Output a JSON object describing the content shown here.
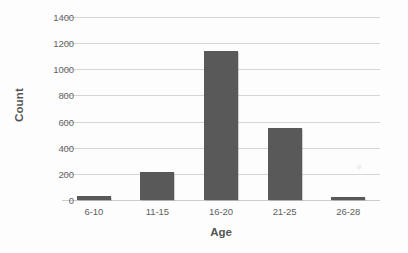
{
  "chart_data": {
    "type": "bar",
    "title": "",
    "categories": [
      "6-10",
      "11-15",
      "16-20",
      "21-25",
      "26-28"
    ],
    "values": [
      30,
      215,
      1140,
      550,
      20
    ],
    "series": [
      {
        "name": "Count",
        "values": [
          30,
          215,
          1140,
          550,
          20
        ]
      }
    ],
    "xlabel": "Age",
    "ylabel": "Count",
    "ylim": [
      0,
      1400
    ],
    "ytick_values": [
      0,
      200,
      400,
      600,
      800,
      1000,
      1200,
      1400
    ],
    "ytick_labels": [
      "0",
      "200",
      "400",
      "600",
      "800",
      "1000",
      "1200",
      "1400"
    ],
    "grid": "horizontal",
    "legend": "none",
    "bar_color": "#595959",
    "gridline_color": "#d6d6d6",
    "background_color": "#ffffff",
    "text_color": "#5f5f5f"
  }
}
